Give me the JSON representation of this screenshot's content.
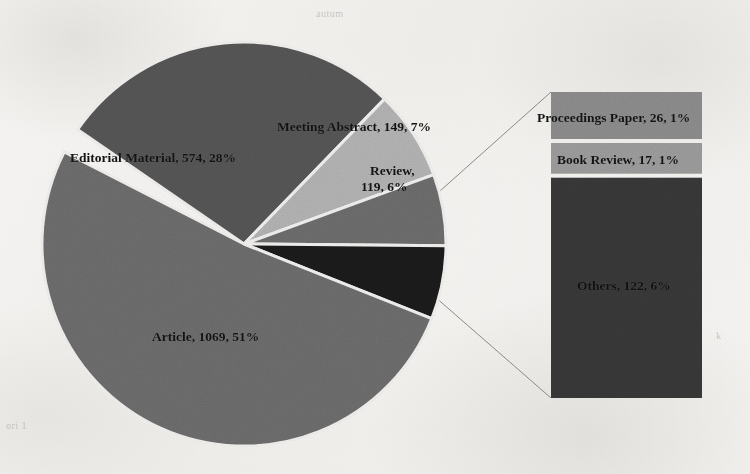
{
  "figure": {
    "kind": "pie-of-bar chart",
    "background_color": "#f2f1ef",
    "text_color": "#141414"
  },
  "chart_data": {
    "type": "pie",
    "title": "",
    "subtitle": "",
    "xlabel": "",
    "ylabel": "",
    "legend_position": "none",
    "grid": false,
    "total": 2076,
    "value_unit": "records",
    "categories": [
      "Article",
      "Editorial Material",
      "Meeting Abstract",
      "Review",
      "Others"
    ],
    "values": [
      1069,
      574,
      149,
      119,
      122
    ],
    "percents": [
      51,
      28,
      7,
      6,
      6
    ],
    "slices": [
      {
        "name": "Editorial Material",
        "value": 574,
        "percent": 28,
        "label": "Editorial Material, 574, 28%",
        "color": "#575757",
        "start_angle_deg": 214.5,
        "sweep_deg": 99.6
      },
      {
        "name": "Meeting Abstract",
        "value": 149,
        "percent": 7,
        "label": "Meeting Abstract, 149, 7%",
        "color": "#b4b4b4",
        "start_angle_deg": 314.1,
        "sweep_deg": 25.8
      },
      {
        "name": "Review",
        "value": 119,
        "percent": 6,
        "label": "Review,\n119, 6%",
        "color": "#6e6e6e",
        "start_angle_deg": 339.9,
        "sweep_deg": 20.6
      },
      {
        "name": "Others",
        "value": 122,
        "percent": 6,
        "label": "",
        "color": "#1e1e1e",
        "start_angle_deg": 0.5,
        "sweep_deg": 21.2,
        "is_exploded_to_bar": true
      },
      {
        "name": "Article",
        "value": 1069,
        "percent": 51,
        "label": "Article, 1069, 51%",
        "color": "#6e6e6e",
        "start_angle_deg": 21.7,
        "sweep_deg": 185.4
      }
    ],
    "secondary_plot": {
      "type": "bar",
      "description": "stacked breakdown of the Others slice",
      "parent_slice": "Others",
      "parent_value": 122,
      "categories": [
        "Proceedings Paper",
        "Book Review",
        "Others"
      ],
      "values": [
        26,
        17,
        122
      ],
      "percents": [
        1,
        1,
        6
      ],
      "segments": [
        {
          "name": "Proceedings Paper",
          "value": 26,
          "percent": 1,
          "label": "Proceedings Paper, 26, 1%",
          "color": "#8e8e8e"
        },
        {
          "name": "Book Review",
          "value": 17,
          "percent": 1,
          "label": "Book Review, 17, 1%",
          "color": "#9d9d9d"
        },
        {
          "name": "Others",
          "value": 122,
          "percent": 6,
          "label": "Others, 122, 6%",
          "color": "#3a3a3a"
        }
      ]
    }
  },
  "pie_labels": {
    "editorial_material": "Editorial Material, 574, 28%",
    "meeting_abstract": "Meeting Abstract, 149, 7%",
    "review_line1": "Review,",
    "review_line2": "119, 6%",
    "article": "Article, 1069, 51%"
  },
  "bar_labels": {
    "proceedings_paper": "Proceedings Paper, 26, 1%",
    "book_review": "Book Review, 17, 1%",
    "others": "Others, 122, 6%"
  },
  "artifacts": {
    "ghost_top": "autum",
    "ghost_left": "ori  1",
    "ghost_right": "k"
  }
}
